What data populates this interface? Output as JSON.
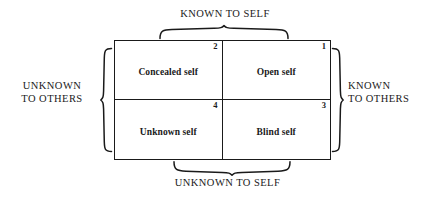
{
  "diagram": {
    "axes": {
      "top": "KNOWN TO SELF",
      "bottom": "UNKNOWN TO SELF",
      "left": "UNKNOWN\nTO OTHERS",
      "right": "KNOWN\nTO OTHERS"
    },
    "quadrants": [
      {
        "number": "2",
        "label": "Concealed self",
        "position": "top-left"
      },
      {
        "number": "1",
        "label": "Open self",
        "position": "top-right"
      },
      {
        "number": "4",
        "label": "Unknown self",
        "position": "bottom-left"
      },
      {
        "number": "3",
        "label": "Blind self",
        "position": "bottom-right"
      }
    ],
    "colors": {
      "ink": "#1a1a1a",
      "background": "#ffffff"
    }
  }
}
